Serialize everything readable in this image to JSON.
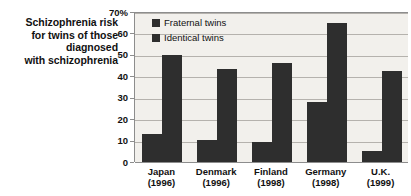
{
  "chart_data": {
    "type": "bar",
    "title": "Schizophrenia risk for twins of those diagnosed with schizophrenia",
    "title_lines": [
      "Schizophrenia risk",
      "for twins of those",
      "diagnosed",
      "with schizophrenia"
    ],
    "xlabel": "",
    "ylabel": "",
    "ylim": [
      0,
      70
    ],
    "yticks": [
      0,
      10,
      20,
      30,
      40,
      50,
      60,
      70
    ],
    "ytick_labels": [
      "0",
      "10",
      "20",
      "30",
      "40",
      "50",
      "60",
      "70%"
    ],
    "grid": true,
    "legend_position": "top-left-inside",
    "categories": [
      "Japan",
      "Denmark",
      "Finland",
      "Germany",
      "U.K."
    ],
    "category_years": [
      "(1996)",
      "(1996)",
      "(1998)",
      "(1998)",
      "(1999)"
    ],
    "category_labels": [
      "Japan (1996)",
      "Denmark (1996)",
      "Finland (1998)",
      "Germany (1998)",
      "U.K. (1999)"
    ],
    "series": [
      {
        "name": "Fraternal twins",
        "color": "#2e2e2e",
        "values": [
          13,
          10.5,
          9.5,
          28,
          5
        ]
      },
      {
        "name": "Identical twins",
        "color": "#2e2e2e",
        "values": [
          50,
          43.5,
          46,
          65,
          42.5
        ]
      }
    ],
    "colors": {
      "bar": "#2e2e2e",
      "plot_background": "#f2f0ec",
      "gridline": "#b5b2ad",
      "axis": "#8d8d8d",
      "text": "#111111",
      "page_background": "#ffffff"
    }
  }
}
